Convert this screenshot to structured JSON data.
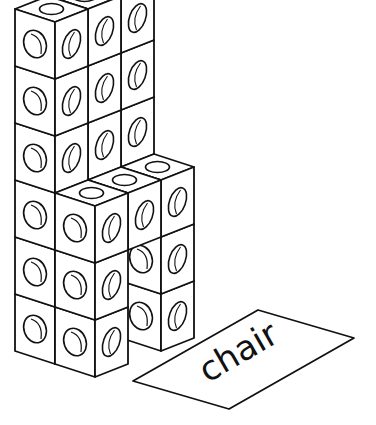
{
  "figure": {
    "label_card": {
      "word": "chair"
    },
    "colors": {
      "stroke": "#111111",
      "fill": "#ffffff"
    },
    "cubes": [
      {
        "col": 0,
        "row": 0,
        "h": 5
      },
      {
        "col": 0,
        "row": 0,
        "h": 4
      },
      {
        "col": 0,
        "row": 0,
        "h": 3
      },
      {
        "col": 0,
        "row": 0,
        "h": 2
      },
      {
        "col": 0,
        "row": 0,
        "h": 1
      },
      {
        "col": 0,
        "row": 0,
        "h": 0
      },
      {
        "col": 1,
        "row": 0,
        "h": 5
      },
      {
        "col": 1,
        "row": 0,
        "h": 4
      },
      {
        "col": 1,
        "row": 0,
        "h": 3
      },
      {
        "col": 2,
        "row": 0,
        "h": 5
      },
      {
        "col": 2,
        "row": 0,
        "h": 4
      },
      {
        "col": 2,
        "row": 0,
        "h": 3
      }
    ]
  }
}
